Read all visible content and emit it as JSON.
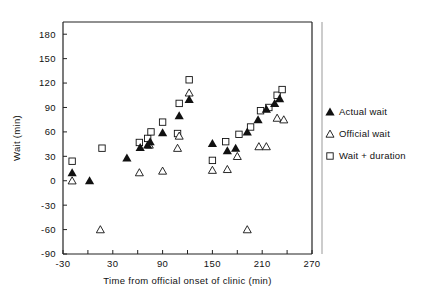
{
  "chart_data": {
    "type": "scatter",
    "title": "",
    "xlabel": "Time from official onset of clinic (min)",
    "ylabel": "Wait (min)",
    "xlim": [
      -30,
      270
    ],
    "ylim": [
      -90,
      195
    ],
    "xticks": [
      -30,
      0,
      30,
      60,
      90,
      120,
      150,
      180,
      210,
      240,
      270
    ],
    "xticklabels": [
      "-30",
      "",
      "30",
      "",
      "90",
      "",
      "150",
      "",
      "210",
      "",
      "270"
    ],
    "yticks": [
      -90,
      -60,
      -30,
      0,
      30,
      60,
      90,
      120,
      150,
      180
    ],
    "yticklabels": [
      "-90",
      "-60",
      "-30",
      "0",
      "30",
      "60",
      "90",
      "120",
      "150",
      "180"
    ],
    "grid": false,
    "legend_position": "right",
    "series": [
      {
        "name": "Actual wait",
        "marker": "filled-triangle",
        "color": "#111111",
        "points": [
          {
            "x": -19,
            "y": 10
          },
          {
            "x": 2,
            "y": 0
          },
          {
            "x": 47,
            "y": 28
          },
          {
            "x": 63,
            "y": 41
          },
          {
            "x": 72,
            "y": 44
          },
          {
            "x": 75,
            "y": 48
          },
          {
            "x": 90,
            "y": 59
          },
          {
            "x": 110,
            "y": 80
          },
          {
            "x": 122,
            "y": 100
          },
          {
            "x": 150,
            "y": 46
          },
          {
            "x": 168,
            "y": 37
          },
          {
            "x": 178,
            "y": 40
          },
          {
            "x": 192,
            "y": 60
          },
          {
            "x": 205,
            "y": 75
          },
          {
            "x": 215,
            "y": 88
          },
          {
            "x": 225,
            "y": 95
          },
          {
            "x": 231,
            "y": 101
          }
        ]
      },
      {
        "name": "Official wait",
        "marker": "open-triangle",
        "color": "#111111",
        "points": [
          {
            "x": -19,
            "y": 0
          },
          {
            "x": 15,
            "y": -60
          },
          {
            "x": 62,
            "y": 10
          },
          {
            "x": 74,
            "y": 44
          },
          {
            "x": 90,
            "y": 12
          },
          {
            "x": 108,
            "y": 40
          },
          {
            "x": 110,
            "y": 55
          },
          {
            "x": 122,
            "y": 108
          },
          {
            "x": 150,
            "y": 13
          },
          {
            "x": 168,
            "y": 14
          },
          {
            "x": 180,
            "y": 30
          },
          {
            "x": 192,
            "y": -60
          },
          {
            "x": 206,
            "y": 42
          },
          {
            "x": 215,
            "y": 42
          },
          {
            "x": 228,
            "y": 77
          },
          {
            "x": 236,
            "y": 75
          }
        ]
      },
      {
        "name": "Wait + duration",
        "marker": "open-square",
        "color": "#111111",
        "points": [
          {
            "x": -19,
            "y": 24
          },
          {
            "x": 17,
            "y": 40
          },
          {
            "x": 62,
            "y": 47
          },
          {
            "x": 72,
            "y": 52
          },
          {
            "x": 76,
            "y": 60
          },
          {
            "x": 90,
            "y": 72
          },
          {
            "x": 108,
            "y": 58
          },
          {
            "x": 110,
            "y": 95
          },
          {
            "x": 122,
            "y": 124
          },
          {
            "x": 150,
            "y": 25
          },
          {
            "x": 166,
            "y": 48
          },
          {
            "x": 182,
            "y": 57
          },
          {
            "x": 196,
            "y": 66
          },
          {
            "x": 208,
            "y": 86
          },
          {
            "x": 218,
            "y": 90
          },
          {
            "x": 228,
            "y": 105
          },
          {
            "x": 234,
            "y": 112
          }
        ]
      }
    ]
  },
  "legend": {
    "entries": [
      {
        "label": "Actual wait",
        "marker": "filled-triangle"
      },
      {
        "label": "Official wait",
        "marker": "open-triangle"
      },
      {
        "label": "Wait + duration",
        "marker": "open-square"
      }
    ]
  }
}
